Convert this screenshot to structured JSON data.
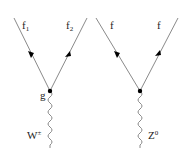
{
  "diagrams": [
    {
      "name": "charged-current-vertex",
      "fermion_in": {
        "base": "f",
        "sub": "1"
      },
      "fermion_out": {
        "base": "f",
        "sub": "2"
      },
      "coupling": "g",
      "boson": {
        "base": "W",
        "sup": "±"
      }
    },
    {
      "name": "neutral-current-vertex",
      "fermion_in": {
        "base": "f",
        "sub": ""
      },
      "fermion_out": {
        "base": "f",
        "sub": ""
      },
      "coupling": "",
      "boson": {
        "base": "Z",
        "sup": "0"
      }
    }
  ],
  "colors": {
    "line": "#8a8a8a",
    "vertex": "#000000",
    "arrow": "#000000",
    "text": "#222222"
  }
}
